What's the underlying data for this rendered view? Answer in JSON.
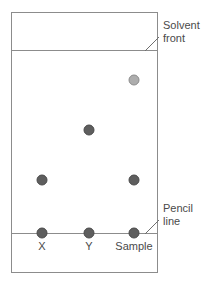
{
  "figure": {
    "plate": {
      "x": 11,
      "y": 12,
      "width": 146,
      "height": 260,
      "border_color": "#8c8c8c",
      "fill_color": "#ffffff"
    },
    "solvent_front": {
      "label_line1": "Solvent",
      "label_line2": "front",
      "y": 50,
      "line_color": "#8c8c8c",
      "leader_from_x": 145,
      "leader_from_y": 51,
      "leader_to_x": 159,
      "leader_to_y": 37,
      "label_x": 163,
      "label_y": 29
    },
    "pencil_line": {
      "label_line1": "Pencil",
      "label_line2": "line",
      "y": 233,
      "line_color": "#8c8c8c",
      "leader_from_x": 145,
      "leader_from_y": 234,
      "leader_to_x": 159,
      "leader_to_y": 220,
      "label_x": 163,
      "label_y": 212
    },
    "lanes": [
      {
        "label": "X",
        "x": 42
      },
      {
        "label": "Y",
        "x": 89
      },
      {
        "label": "Sample",
        "x": 134
      }
    ],
    "lane_label_y": 250,
    "spots": [
      {
        "lane": "X",
        "cx": 42,
        "cy": 233,
        "r": 5,
        "color": "#5e5e5e",
        "stroke": "#4a4a4a"
      },
      {
        "lane": "Y",
        "cx": 89,
        "cy": 233,
        "r": 5,
        "color": "#5e5e5e",
        "stroke": "#4a4a4a"
      },
      {
        "lane": "Sample",
        "cx": 134,
        "cy": 233,
        "r": 5,
        "color": "#5e5e5e",
        "stroke": "#4a4a4a"
      },
      {
        "lane": "X",
        "cx": 42,
        "cy": 180,
        "r": 5,
        "color": "#5e5e5e",
        "stroke": "#4a4a4a"
      },
      {
        "lane": "Sample",
        "cx": 134,
        "cy": 180,
        "r": 5,
        "color": "#5e5e5e",
        "stroke": "#4a4a4a"
      },
      {
        "lane": "Y",
        "cx": 89,
        "cy": 130,
        "r": 5,
        "color": "#5e5e5e",
        "stroke": "#4a4a4a"
      },
      {
        "lane": "Sample",
        "cx": 134,
        "cy": 80,
        "r": 5,
        "color": "#adadad",
        "stroke": "#8c8c8c"
      }
    ]
  }
}
